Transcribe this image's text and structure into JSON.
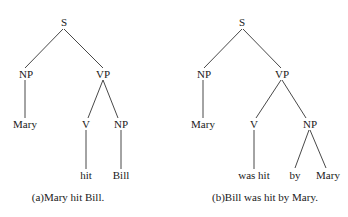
{
  "figure": {
    "trees": [
      {
        "caption": "(a)Mary hit Bill.",
        "nodes": {
          "s": "S",
          "np": "NP",
          "vp": "VP",
          "np_leaf": "Mary",
          "v": "V",
          "obj_np": "NP",
          "v_leaf": "hit",
          "obj_leaf": "Bill"
        }
      },
      {
        "caption": "(b)Bill was hit by Mary.",
        "nodes": {
          "s": "S",
          "np": "NP",
          "vp": "VP",
          "np_leaf": "Mary",
          "v": "V",
          "obj_np": "NP",
          "v_leaf": "was hit",
          "by_leaf": "by",
          "agent_leaf": "Mary"
        }
      }
    ]
  }
}
